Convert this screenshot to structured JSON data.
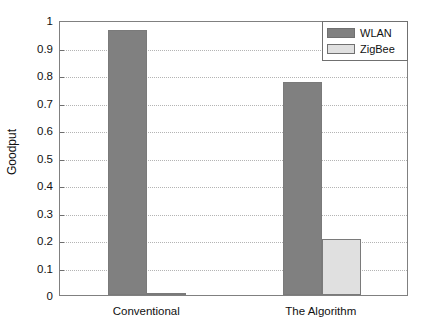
{
  "chart_data": {
    "type": "bar",
    "title": "",
    "xlabel": "",
    "ylabel": "Goodput",
    "categories": [
      "Conventional",
      "The Algorithm"
    ],
    "series": [
      {
        "name": "WLAN",
        "color": "#808080",
        "values": [
          0.964,
          0.775
        ]
      },
      {
        "name": "ZigBee",
        "color": "#e0e0e0",
        "values": [
          0.005,
          0.205
        ]
      }
    ],
    "ylim": [
      0,
      1
    ],
    "ytick_labels": [
      "0",
      "0.1",
      "0.2",
      "0.3",
      "0.4",
      "0.5",
      "0.6",
      "0.7",
      "0.8",
      "0.9",
      "1"
    ],
    "ytick_values": [
      0,
      0.1,
      0.2,
      0.3,
      0.4,
      0.5,
      0.6,
      0.7,
      0.8,
      0.9,
      1
    ],
    "grid": true,
    "grid_style": "dotted",
    "legend_position": "top-right",
    "background_color": "#ffffff",
    "axis_color": "#808080"
  },
  "axes": {
    "y_title": "Goodput"
  },
  "legend": {
    "entries": [
      {
        "label": "WLAN"
      },
      {
        "label": "ZigBee"
      }
    ]
  }
}
